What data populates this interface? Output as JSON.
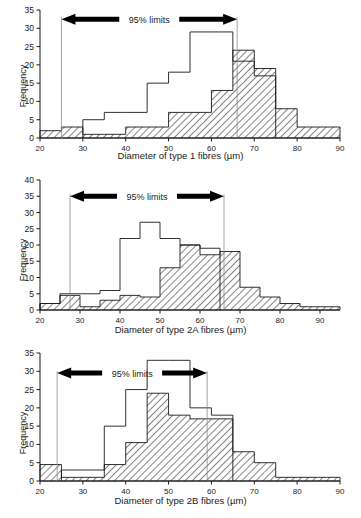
{
  "figure": {
    "title": "",
    "annotation_label": "95% limits",
    "ylabel": "Frequency",
    "hatch_color": "#1a1a1a",
    "outline_color": "#1a1a1a",
    "limit_line_color": "#8a8a8a"
  },
  "chart_data": [
    {
      "type": "bar",
      "id": "type-1-fibres",
      "title": "",
      "xlabel": "Diameter of type 1 fibres (µm)",
      "ylabel": "Frequency",
      "xlim": [
        20,
        90
      ],
      "ylim": [
        0,
        35
      ],
      "xticks": [
        20,
        30,
        40,
        50,
        60,
        70,
        80,
        90
      ],
      "yticks": [
        0,
        5,
        10,
        15,
        20,
        25,
        30,
        35
      ],
      "grid": false,
      "legend": null,
      "bin_edges": [
        20,
        25,
        30,
        35,
        40,
        45,
        50,
        55,
        60,
        65,
        70,
        75,
        80,
        85
      ],
      "series": [
        {
          "name": "hatched",
          "style": "hatched",
          "values": [
            2,
            3,
            1,
            1,
            3,
            3,
            7,
            7,
            13,
            24,
            19,
            8,
            3,
            3
          ]
        },
        {
          "name": "outline",
          "style": "outline",
          "values": [
            0,
            0,
            5,
            7,
            7,
            15,
            18,
            29,
            29,
            21,
            17,
            0,
            0,
            0
          ]
        }
      ],
      "annotation": {
        "label": "95% limits",
        "lower": 25,
        "upper": 66,
        "y": 32.5
      }
    },
    {
      "type": "bar",
      "id": "type-2a-fibres",
      "title": "",
      "xlabel": "Diameter of type 2A fibres (µm)",
      "ylabel": "Frequency",
      "xlim": [
        20,
        95
      ],
      "ylim": [
        0,
        40
      ],
      "xticks": [
        20,
        30,
        40,
        50,
        60,
        70,
        80,
        90
      ],
      "yticks": [
        0,
        5,
        10,
        15,
        20,
        25,
        30,
        35,
        40
      ],
      "grid": false,
      "legend": null,
      "bin_edges": [
        20,
        25,
        30,
        35,
        40,
        45,
        50,
        55,
        60,
        65,
        70,
        75,
        80,
        85,
        90,
        95
      ],
      "series": [
        {
          "name": "hatched",
          "style": "hatched",
          "values": [
            2,
            4.5,
            1,
            3,
            4.5,
            4,
            13,
            20,
            17,
            18,
            7,
            4,
            2,
            1,
            1
          ]
        },
        {
          "name": "outline",
          "style": "outline",
          "values": [
            2,
            5,
            5,
            6,
            22,
            27,
            22,
            20,
            19,
            0,
            0,
            0,
            0,
            0,
            0
          ]
        }
      ],
      "annotation": {
        "label": "95% limits",
        "lower": 27.5,
        "upper": 66,
        "y": 35
      }
    },
    {
      "type": "bar",
      "id": "type-2b-fibres",
      "title": "",
      "xlabel": "Diameter of type 2B fibres (µm)",
      "ylabel": "Frequency",
      "xlim": [
        20,
        90
      ],
      "ylim": [
        0,
        35
      ],
      "xticks": [
        20,
        30,
        40,
        50,
        60,
        70,
        80,
        90
      ],
      "yticks": [
        0,
        5,
        10,
        15,
        20,
        25,
        30,
        35
      ],
      "grid": false,
      "legend": null,
      "bin_edges": [
        20,
        25,
        30,
        35,
        40,
        45,
        50,
        55,
        60,
        65,
        70,
        75,
        80,
        85
      ],
      "series": [
        {
          "name": "hatched",
          "style": "hatched",
          "values": [
            4.5,
            1,
            1,
            4.5,
            10.5,
            24,
            18,
            17,
            17,
            8,
            5,
            1,
            1,
            1
          ]
        },
        {
          "name": "outline",
          "style": "outline",
          "values": [
            0,
            3,
            3,
            15,
            25,
            33,
            33,
            20,
            18,
            0,
            0,
            0,
            0,
            0
          ]
        }
      ],
      "annotation": {
        "label": "95% limits",
        "lower": 24,
        "upper": 59,
        "y": 29.5
      }
    }
  ]
}
